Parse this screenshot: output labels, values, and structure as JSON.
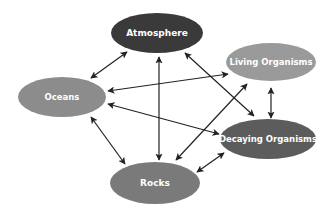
{
  "diagram": {
    "type": "cycle-diagram",
    "background": "#ffffff",
    "arrow_color": "#222222",
    "nodes": [
      {
        "id": "atmosphere",
        "label": "Atmosphere",
        "cx": 157,
        "cy": 33,
        "rx": 46,
        "ry": 20,
        "fill": "#3a3a3a",
        "font_size": 9
      },
      {
        "id": "living",
        "label": "Living Organisms",
        "cx": 271,
        "cy": 62,
        "rx": 45,
        "ry": 19,
        "fill": "#9a9a9a",
        "font_size": 8.5
      },
      {
        "id": "oceans",
        "label": "Oceans",
        "cx": 62,
        "cy": 97,
        "rx": 44,
        "ry": 20,
        "fill": "#8c8c8c",
        "font_size": 8.5
      },
      {
        "id": "decaying",
        "label": "Decaying Organisms",
        "cx": 268,
        "cy": 139,
        "rx": 48,
        "ry": 20,
        "fill": "#5c5c5c",
        "font_size": 8.5
      },
      {
        "id": "rocks",
        "label": "Rocks",
        "cx": 155,
        "cy": 183,
        "rx": 45,
        "ry": 21,
        "fill": "#7a7a7a",
        "font_size": 9
      }
    ],
    "edges": [
      {
        "from": "oceans",
        "to": "atmosphere",
        "x1": 91,
        "y1": 78,
        "x2": 127,
        "y2": 52,
        "bidirectional": true
      },
      {
        "from": "atmosphere",
        "to": "rocks",
        "x1": 159,
        "y1": 57,
        "x2": 159,
        "y2": 160,
        "bidirectional": true
      },
      {
        "from": "atmosphere",
        "to": "decaying",
        "x1": 185,
        "y1": 53,
        "x2": 254,
        "y2": 116,
        "bidirectional": true
      },
      {
        "from": "oceans",
        "to": "living",
        "x1": 108,
        "y1": 91,
        "x2": 228,
        "y2": 74,
        "bidirectional": true
      },
      {
        "from": "oceans",
        "to": "decaying",
        "x1": 108,
        "y1": 104,
        "x2": 219,
        "y2": 134,
        "bidirectional": true
      },
      {
        "from": "living",
        "to": "decaying",
        "x1": 271,
        "y1": 88,
        "x2": 271,
        "y2": 118,
        "bidirectional": true
      },
      {
        "from": "living",
        "to": "rocks",
        "x1": 247,
        "y1": 84,
        "x2": 176,
        "y2": 160,
        "bidirectional": true
      },
      {
        "from": "oceans",
        "to": "rocks",
        "x1": 91,
        "y1": 117,
        "x2": 125,
        "y2": 164,
        "bidirectional": true
      },
      {
        "from": "rocks",
        "to": "decaying",
        "x1": 197,
        "y1": 172,
        "x2": 224,
        "y2": 153,
        "bidirectional": true
      }
    ]
  }
}
